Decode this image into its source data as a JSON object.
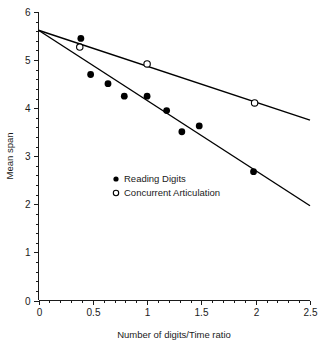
{
  "chart_data": {
    "type": "scatter",
    "title": "",
    "xlabel": "Number of digits/Time ratio",
    "ylabel": "Mean span",
    "xlim": [
      0,
      2.5
    ],
    "ylim": [
      0,
      6
    ],
    "xticks": [
      0,
      0.5,
      1,
      1.5,
      2,
      2.5
    ],
    "xticklabels": [
      "0",
      "0.5",
      "1",
      "1.5",
      "2",
      "2.5"
    ],
    "yticks": [
      0,
      1,
      2,
      3,
      4,
      5,
      6
    ],
    "yticklabels": [
      "0",
      "1",
      "2",
      "3",
      "4",
      "5",
      "6"
    ],
    "x_minor_step": 0.1,
    "y_minor_step": 0.2,
    "grid": false,
    "legend_position": "center-left",
    "series": [
      {
        "name": "Reading Digits",
        "marker": "filled-circle",
        "color": "#000000",
        "points": [
          {
            "x": 0.39,
            "y": 5.45
          },
          {
            "x": 0.48,
            "y": 4.7
          },
          {
            "x": 0.64,
            "y": 4.51
          },
          {
            "x": 0.79,
            "y": 4.25
          },
          {
            "x": 1.0,
            "y": 4.25
          },
          {
            "x": 1.18,
            "y": 3.95
          },
          {
            "x": 1.32,
            "y": 3.51
          },
          {
            "x": 1.48,
            "y": 3.63
          },
          {
            "x": 1.98,
            "y": 2.68
          }
        ],
        "fit_line": {
          "x0": 0,
          "y0": 5.62,
          "x1": 2.5,
          "y1": 1.97
        }
      },
      {
        "name": "Concurrent Articulation",
        "marker": "open-circle",
        "color": "#000000",
        "points": [
          {
            "x": 0.38,
            "y": 5.27
          },
          {
            "x": 1.0,
            "y": 4.92
          },
          {
            "x": 1.99,
            "y": 4.11
          }
        ],
        "fit_line": {
          "x0": 0,
          "y0": 5.62,
          "x1": 2.5,
          "y1": 3.75
        }
      }
    ]
  },
  "legend": {
    "items": [
      {
        "label": "Reading Digits",
        "marker": "filled-circle"
      },
      {
        "label": "Concurrent Articulation",
        "marker": "open-circle"
      }
    ]
  }
}
